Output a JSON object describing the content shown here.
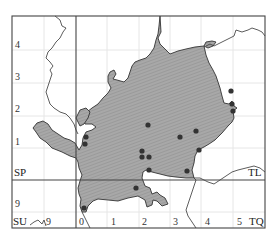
{
  "map": {
    "grid_squares": {
      "top_left": "SP",
      "top_right": "TL",
      "bottom_left": "SU",
      "bottom_right": "TQ"
    },
    "northing_labels": [
      {
        "label": "4",
        "y": 43
      },
      {
        "label": "3",
        "y": 76
      },
      {
        "label": "2",
        "y": 108
      },
      {
        "label": "1",
        "y": 141
      },
      {
        "label": "9",
        "y": 203
      }
    ],
    "easting_labels": [
      {
        "label": "9",
        "x": 46
      },
      {
        "label": "0",
        "x": 79
      },
      {
        "label": "1",
        "x": 112
      },
      {
        "label": "2",
        "x": 143
      },
      {
        "label": "3",
        "x": 174
      },
      {
        "label": "4",
        "x": 206
      },
      {
        "label": "5",
        "x": 237
      }
    ],
    "colors": {
      "county_fill": "#a6a6a6",
      "county_hatch": "#8a8a8a",
      "border": "#333333",
      "grid_major": "#444444",
      "grid_minor": "#e4e4e4",
      "record_dot": "#333333"
    },
    "records": [
      {
        "x": 86,
        "y": 137
      },
      {
        "x": 85,
        "y": 144
      },
      {
        "x": 148,
        "y": 125
      },
      {
        "x": 196,
        "y": 131
      },
      {
        "x": 180,
        "y": 137
      },
      {
        "x": 142,
        "y": 151
      },
      {
        "x": 142,
        "y": 157
      },
      {
        "x": 149,
        "y": 157
      },
      {
        "x": 149,
        "y": 170
      },
      {
        "x": 187,
        "y": 171
      },
      {
        "x": 199,
        "y": 150
      },
      {
        "x": 136,
        "y": 188
      },
      {
        "x": 84,
        "y": 208
      },
      {
        "x": 232,
        "y": 104
      },
      {
        "x": 233,
        "y": 111
      },
      {
        "x": 231,
        "y": 91
      }
    ]
  }
}
